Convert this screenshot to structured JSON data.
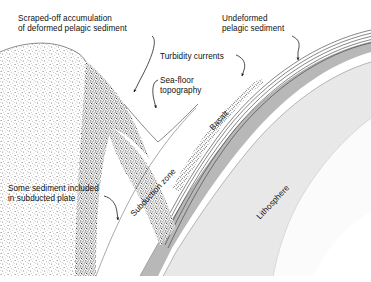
{
  "figure": {
    "width": 371,
    "height": 282
  },
  "labels": {
    "scraped_off": "Scraped-off accumulation\nof deformed pelagic sediment",
    "undeformed": "Undeformed\npelagic sediment",
    "turbidity": "Turbidity currents",
    "seafloor": "Sea-floor\ntopography",
    "some_sediment": "Some sediment included\nin subducted plate",
    "basalt": "Basalt",
    "subduction_zone": "Subduction zone",
    "lithosphere": "Lithosphere"
  },
  "colors": {
    "background": "#ffffff",
    "ink": "#111111",
    "wedge_stipple_dark": "#3a3a3a",
    "overriding_plate_stipple": "#6e6e6e",
    "basalt_band": "#b9b9b9",
    "lithosphere_fill": "#e6e6e6",
    "asthenosphere_fill": "#ffffff",
    "sediment_layer_line": "#444444"
  }
}
